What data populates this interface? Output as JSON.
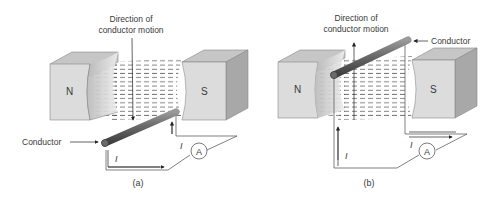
{
  "panels": [
    {
      "id": "a",
      "caption": "(a)",
      "motion_label_line1": "Direction of",
      "motion_label_line2": "conductor motion",
      "motion_direction": "down",
      "conductor_label": "Conductor",
      "north_pole": "N",
      "south_pole": "S",
      "current_symbol_1": "I",
      "current_symbol_2": "I",
      "ammeter": "A"
    },
    {
      "id": "b",
      "caption": "(b)",
      "motion_label_line1": "Direction of",
      "motion_label_line2": "conductor motion",
      "motion_direction": "up",
      "conductor_label": "Conductor",
      "north_pole": "N",
      "south_pole": "S",
      "current_symbol_1": "I",
      "current_symbol_2": "I",
      "ammeter": "A"
    }
  ],
  "colors": {
    "magnet_front": "#d9d9d9",
    "magnet_top": "#c4c4c4",
    "magnet_side": "#a9a9a9",
    "field_lines": "#555555",
    "conductor": "#6e6e6e",
    "wire": "#4a4a4a"
  }
}
